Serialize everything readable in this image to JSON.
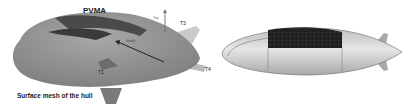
{
  "figure": {
    "left_panel": {
      "title": "PVMA",
      "caption": "Surface mesh of the hull",
      "labels": {
        "top_axis": "Top",
        "south_axis": "South",
        "t1": "T1",
        "t3": "T3",
        "t4": "T4"
      }
    },
    "right_panel": {
      "description": "Side view of airship with solar panel array mesh"
    },
    "colors": {
      "hull_left": "#8d8d8d",
      "panel_dark": "#3a3a3a",
      "hull_right": "#d4d4d4",
      "panel_grid": "#1c1c1c"
    }
  }
}
